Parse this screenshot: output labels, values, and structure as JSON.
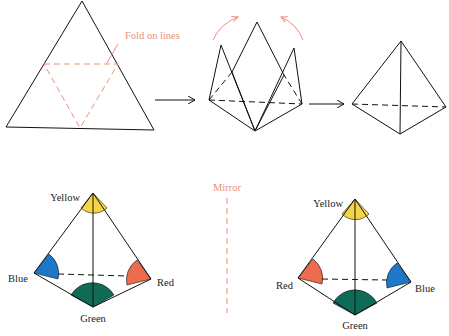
{
  "colors": {
    "annotation": "#E8907A",
    "yellow": "#F5D547",
    "blue": "#1E78C8",
    "green": "#0E6B55",
    "red": "#EE6B4D",
    "line": "#111111"
  },
  "step1": {
    "annotation": "Fold on lines"
  },
  "mirror": {
    "label": "Mirror"
  },
  "tetra_left": {
    "labels": {
      "top": "Yellow",
      "left": "Blue",
      "right": "Red",
      "bottom": "Green"
    }
  },
  "tetra_right": {
    "labels": {
      "top": "Yellow",
      "left": "Red",
      "right": "Blue",
      "bottom": "Green"
    }
  }
}
